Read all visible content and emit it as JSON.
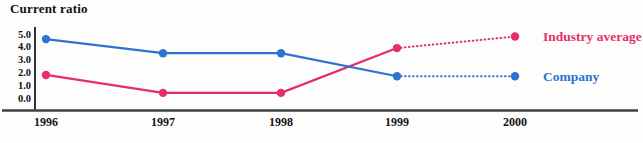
{
  "title": "Current ratio",
  "colors": {
    "company": "#2e72d2",
    "industry": "#e62e68",
    "axis_line": "#3f3f49",
    "yaxis_line": "#1a1a24",
    "text": "#111118"
  },
  "chart_data": {
    "type": "line",
    "title": "Current ratio",
    "x": [
      "1996",
      "1997",
      "1998",
      "1999",
      "2000"
    ],
    "series": [
      {
        "name": "Industry average",
        "values": [
          1.8,
          0.4,
          0.4,
          3.9,
          4.8
        ],
        "color_key": "industry",
        "dotted_from_index": 3
      },
      {
        "name": "Company",
        "values": [
          4.6,
          3.5,
          3.5,
          1.7,
          1.7
        ],
        "color_key": "company",
        "dotted_from_index": 3
      }
    ],
    "yticks": [
      "5.0",
      "4.0",
      "3.0",
      "2.0",
      "1.0",
      "0.0"
    ],
    "ylim": [
      0,
      5
    ],
    "xlabel": "",
    "ylabel": "",
    "grid": false,
    "legend_position": "right-of-last-point",
    "marker": "circle",
    "style_note": "solid lines 1996-1999, dotted projection 1999-2000"
  }
}
